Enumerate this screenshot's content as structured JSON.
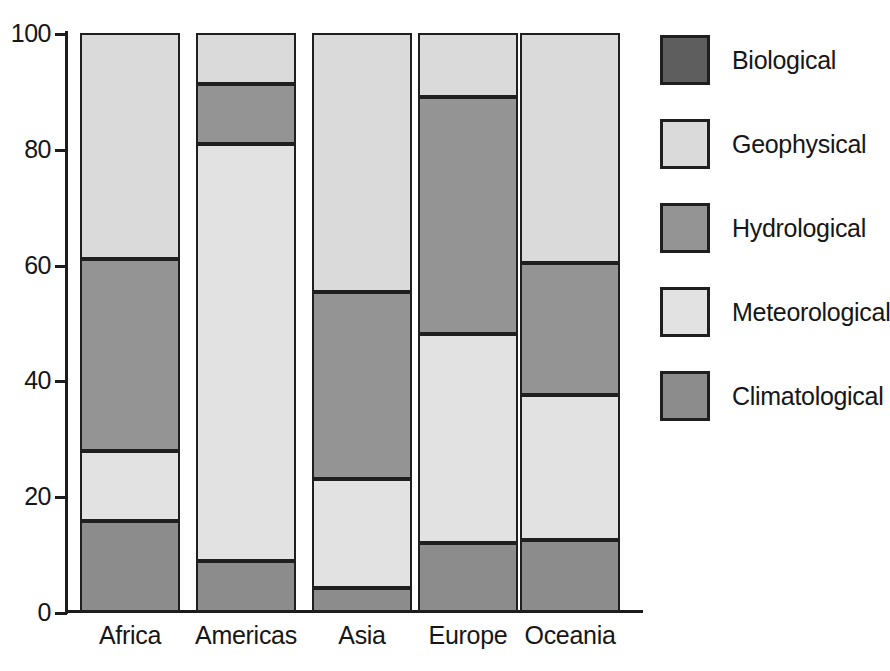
{
  "chart_data": {
    "type": "bar",
    "subtype": "stacked-bar-100-percent",
    "title": "",
    "xlabel": "",
    "ylabel": "",
    "ylim": [
      0,
      100
    ],
    "yticks": [
      0,
      20,
      40,
      60,
      80,
      100
    ],
    "ytick_labels": [
      "0",
      "20",
      "40",
      "60",
      "80",
      "100"
    ],
    "grid": false,
    "legend_position": "right",
    "categories": [
      "Africa",
      "Americas",
      "Asia",
      "Europe",
      "Oceania"
    ],
    "series": [
      {
        "name": "Biological",
        "color": "#5e5e5e",
        "values": [
          0,
          0,
          0,
          0,
          0
        ]
      },
      {
        "name": "Geophysical",
        "color": "#dadada",
        "values": [
          39.0,
          8.8,
          44.7,
          11.0,
          39.8
        ]
      },
      {
        "name": "Hydrological",
        "color": "#949494",
        "values": [
          33.2,
          10.4,
          32.3,
          41.0,
          22.7
        ]
      },
      {
        "name": "Meteorological",
        "color": "#e2e2e2",
        "values": [
          12.1,
          72.0,
          18.8,
          36.0,
          25.0
        ]
      },
      {
        "name": "Climatological",
        "color": "#8c8c8c",
        "values": [
          15.7,
          8.8,
          4.2,
          12.0,
          12.5
        ]
      }
    ],
    "stack_order_bottom_to_top": [
      "Climatological",
      "Meteorological",
      "Hydrological",
      "Geophysical",
      "Biological"
    ],
    "cumulative_boundaries": {
      "Africa": [
        0,
        15.7,
        27.8,
        61.0,
        100.0
      ],
      "Americas": [
        0,
        8.8,
        80.8,
        91.2,
        100.0
      ],
      "Asia": [
        0,
        4.2,
        23.0,
        55.3,
        100.0
      ],
      "Europe": [
        0,
        12.0,
        48.0,
        89.0,
        100.0
      ],
      "Oceania": [
        0,
        12.5,
        37.5,
        60.2,
        100.0
      ]
    }
  },
  "legend": {
    "items": [
      {
        "label": "Biological",
        "color": "#5e5e5e"
      },
      {
        "label": "Geophysical",
        "color": "#dadada"
      },
      {
        "label": "Hydrological",
        "color": "#949494"
      },
      {
        "label": "Meteorological",
        "color": "#e2e2e2"
      },
      {
        "label": "Climatological",
        "color": "#8c8c8c"
      }
    ]
  },
  "axes": {
    "y_tick_labels": [
      "100",
      "80",
      "60",
      "40",
      "20",
      "0"
    ],
    "x_tick_labels": [
      "Africa",
      "Americas",
      "Asia",
      "Europe",
      "Oceania"
    ]
  },
  "colors": {
    "axis": "#1c1c1c",
    "segment_border": "#1f1f1f",
    "background": "#ffffff",
    "text": "#161616"
  }
}
